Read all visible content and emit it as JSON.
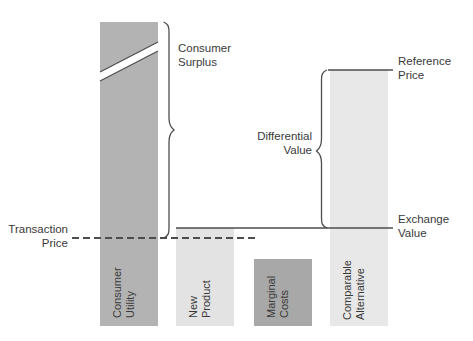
{
  "diagram": {
    "background_color": "#ffffff",
    "line_color": "#4d4d4d",
    "text_color": "#3a3a3a"
  },
  "bars": [
    {
      "id": "consumer-utility",
      "label_line1": "Consumer",
      "label_line2": "Utility",
      "color": "#b3b3b3",
      "x": 100,
      "y": 22,
      "width": 58,
      "height": 304,
      "has_break_slash": true
    },
    {
      "id": "new-product",
      "label_line1": "New",
      "label_line2": "Product",
      "color": "#e3e3e3",
      "x": 176,
      "y": 228,
      "width": 58,
      "height": 98,
      "has_break_slash": false
    },
    {
      "id": "marginal-costs",
      "label_line1": "Marginal",
      "label_line2": "Costs",
      "color": "#a8a8a8",
      "x": 254,
      "y": 259,
      "width": 58,
      "height": 67,
      "has_break_slash": false
    },
    {
      "id": "comparable-alternative",
      "label_line1": "Comparable",
      "label_line2": "Alternative",
      "color": "#e8e8e8",
      "x": 330,
      "y": 70,
      "width": 58,
      "height": 256,
      "has_break_slash": false
    }
  ],
  "annotations": {
    "consumer_surplus": {
      "line1": "Consumer",
      "line2": "Surplus",
      "text_x": 178,
      "text_y": 52,
      "brace_top": 22,
      "brace_bottom": 238,
      "brace_x": 163
    },
    "differential_value": {
      "line1": "Differential",
      "line2": "Value",
      "text_x": 320,
      "text_y": 140,
      "brace_top": 70,
      "brace_bottom": 228,
      "brace_x": 326
    },
    "transaction_price": {
      "line1": "Transaction",
      "line2": "Price",
      "text_x": 68,
      "text_y": 232,
      "dash_y": 238,
      "dash_x1": 72,
      "dash_x2": 256
    },
    "reference_price": {
      "line1": "Reference",
      "line2": "Price",
      "text_x": 398,
      "text_y": 64,
      "rule_y": 70,
      "rule_x1": 328,
      "rule_x2": 393
    },
    "exchange_value": {
      "line1": "Exchange",
      "line2": "Value",
      "text_x": 398,
      "text_y": 222,
      "rule_y": 228,
      "rule_x1": 176,
      "rule_x2": 393
    }
  }
}
